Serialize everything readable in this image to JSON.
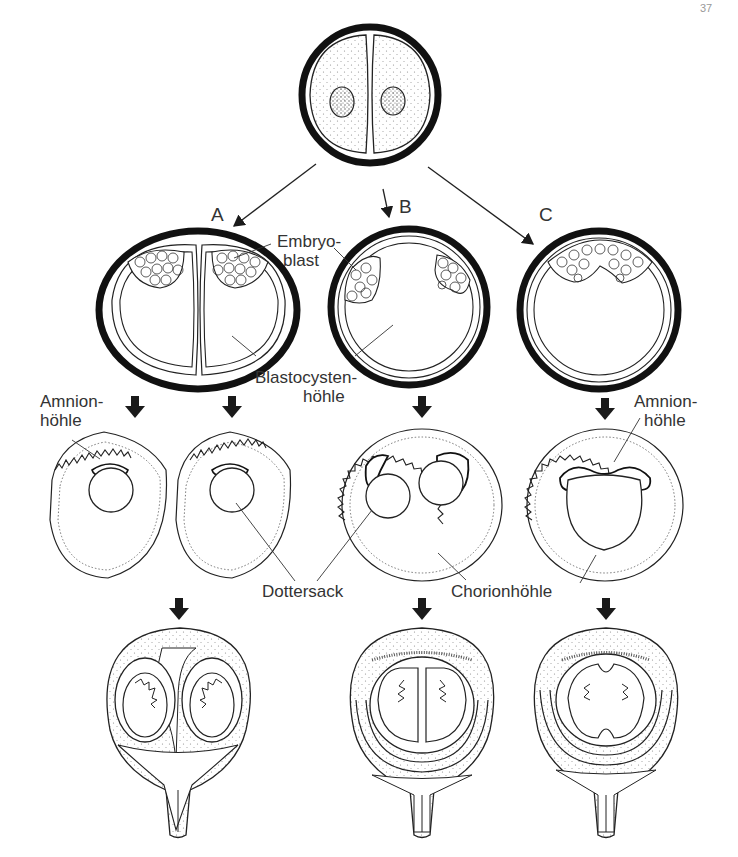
{
  "figure": {
    "page_mark": "37",
    "branches": [
      {
        "id": "A",
        "label": "A"
      },
      {
        "id": "B",
        "label": "B"
      },
      {
        "id": "C",
        "label": "C"
      }
    ],
    "labels": {
      "embryoblast_line1": "Embryo-",
      "embryoblast_line2": "blast",
      "blastocyst_line1": "Blastocysten-",
      "blastocyst_line2": "höhle",
      "amnion_left_line1": "Amnion-",
      "amnion_left_line2": "höhle",
      "amnion_right_line1": "Amnion-",
      "amnion_right_line2": "höhle",
      "yolk_sac": "Dottersack",
      "chorion": "Chorionhöhle"
    },
    "stages": [
      {
        "row": 1,
        "name": "two-cell-stage"
      },
      {
        "row": 2,
        "name": "blastocyst-stage"
      },
      {
        "row": 3,
        "name": "implantation-stage"
      },
      {
        "row": 4,
        "name": "fetal-stage-in-uterus"
      }
    ],
    "colors": {
      "ink": "#1a1a1a",
      "stipple": "#9a9a9a",
      "background": "#ffffff"
    }
  }
}
